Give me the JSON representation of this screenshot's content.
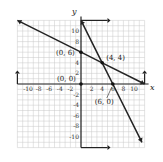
{
  "chart_data": {
    "type": "line",
    "title": "",
    "xlabel": "x",
    "ylabel": "y",
    "xlim": [
      -12,
      12
    ],
    "ylim": [
      -12,
      12
    ],
    "grid": true,
    "x_ticks": [
      -10,
      -8,
      -6,
      -4,
      -2,
      2,
      4,
      6,
      8,
      10
    ],
    "y_ticks": [
      10,
      8,
      4,
      2,
      -2,
      -4,
      -6,
      -8,
      -10
    ],
    "series": [
      {
        "name": "line through (0,6) and (4,4)",
        "points": [
          [
            -12,
            12
          ],
          [
            0,
            6
          ],
          [
            4,
            4
          ],
          [
            12,
            0
          ]
        ]
      },
      {
        "name": "line through (0,12) and (6,0)",
        "points": [
          [
            0,
            12
          ],
          [
            4,
            4
          ],
          [
            6,
            0
          ],
          [
            11.5,
            -11
          ]
        ]
      }
    ],
    "boundary_rays": [
      {
        "name": "y-axis upper boundary",
        "points": [
          [
            0,
            12
          ],
          [
            5,
            12
          ]
        ]
      },
      {
        "name": "y-axis lower boundary",
        "points": [
          [
            0,
            -12
          ],
          [
            5,
            -12
          ]
        ]
      },
      {
        "name": "x-axis left boundary",
        "points": [
          [
            -12,
            0
          ],
          [
            -12,
            2
          ]
        ]
      },
      {
        "name": "x-axis right boundary",
        "points": [
          [
            12,
            0
          ],
          [
            12,
            2
          ]
        ]
      }
    ],
    "annotations": [
      {
        "text": "(0, 6)",
        "x": 0,
        "y": 6
      },
      {
        "text": "(4, 4)",
        "x": 4,
        "y": 4
      },
      {
        "text": "(0, 0)",
        "x": 0,
        "y": 0
      },
      {
        "text": "(6, 0)",
        "x": 6,
        "y": 0
      }
    ]
  }
}
